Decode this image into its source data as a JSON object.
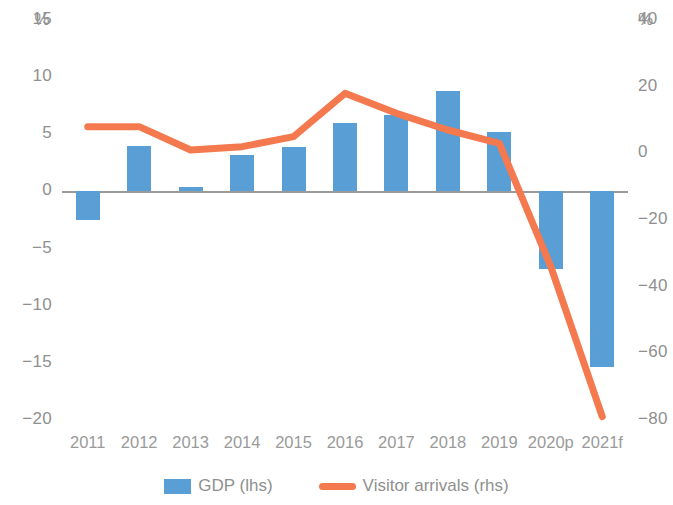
{
  "chart_data": {
    "type": "bar",
    "title": "",
    "categories": [
      "2011",
      "2012",
      "2013",
      "2014",
      "2015",
      "2016",
      "2017",
      "2018",
      "2019",
      "2020p",
      "2021f"
    ],
    "series": [
      {
        "name": "GDP (lhs)",
        "type": "bar",
        "axis": "left",
        "color": "#599ed4",
        "values": [
          -2.5,
          4.0,
          0.4,
          3.2,
          3.9,
          6.0,
          6.7,
          8.8,
          5.2,
          -6.8,
          -15.4
        ]
      },
      {
        "name": "Visitor arrivals (rhs)",
        "type": "line",
        "axis": "right",
        "color": "#f4794f",
        "values": [
          8,
          8,
          1,
          2,
          5,
          18,
          12,
          7,
          3,
          -34,
          -79
        ]
      }
    ],
    "xlabel": "",
    "ylabel": "%",
    "ylabel_right": "%",
    "ylim": [
      -20,
      15
    ],
    "ylim_right": [
      -80,
      40
    ],
    "yticks": [
      "15",
      "10",
      "5",
      "0",
      "−5",
      "−10",
      "−15",
      "−20"
    ],
    "yticks_right": [
      "40",
      "20",
      "0",
      "−20",
      "−40",
      "−60",
      "−80"
    ],
    "grid": false,
    "legend_position": "bottom"
  },
  "axes": {
    "left_unit": "%",
    "right_unit": "%"
  },
  "legend": {
    "items": [
      {
        "label": "GDP (lhs)",
        "marker": "bar-swatch"
      },
      {
        "label": "Visitor arrivals (rhs)",
        "marker": "line-swatch"
      }
    ]
  }
}
